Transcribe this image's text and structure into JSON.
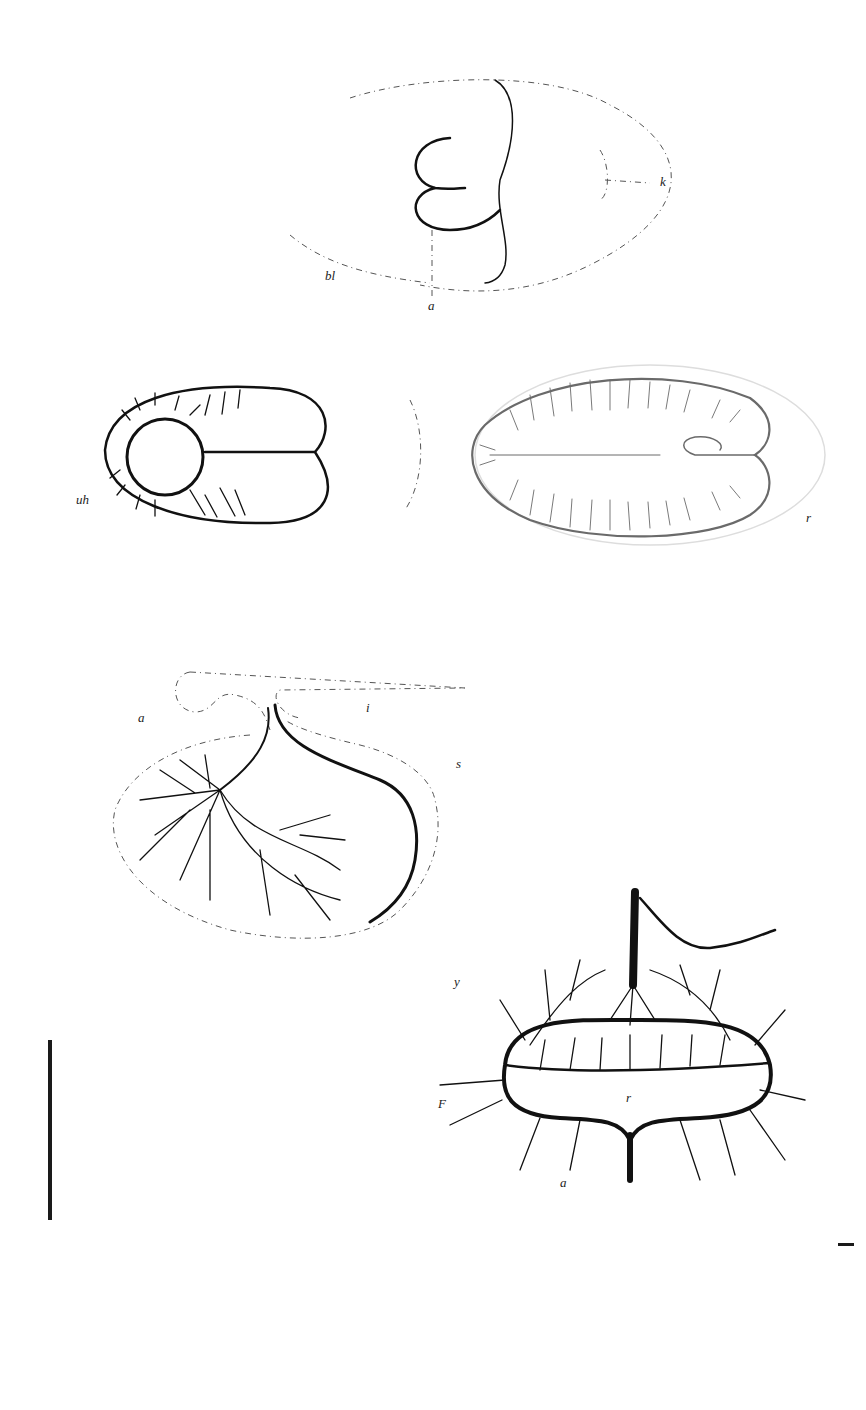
{
  "plate": {
    "description": "Plate of scientific line illustrations showing vascular areas of embryos",
    "figures": [
      {
        "id": "figure-1",
        "description": "Outline of blastoderm with embryo fold, dotted contours",
        "labels": {
          "bl": "bl",
          "a": "a",
          "k": "k"
        }
      },
      {
        "id": "figure-2",
        "description": "Oval vascular area with circular sinus at left",
        "labels": {
          "uh": "uh"
        }
      },
      {
        "id": "figure-3",
        "description": "Oval vascular area with branching vessels, faint gray",
        "labels": {
          "r": "r"
        }
      },
      {
        "id": "figure-4",
        "description": "Vascular network with stalk and branching arteries",
        "labels": {
          "a": "a",
          "i": "i",
          "s": "s"
        }
      },
      {
        "id": "figure-5",
        "description": "Vascular ring with central vessel and stalk",
        "labels": {
          "y": "y",
          "F": "F",
          "a": "a",
          "r": "r"
        }
      }
    ]
  },
  "colors": {
    "ink": "#111111",
    "background": "#ffffff",
    "faint": "#6a6a6a"
  }
}
